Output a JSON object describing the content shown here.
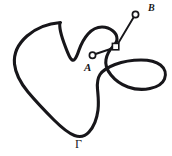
{
  "figure": {
    "kind": "jordan-curve-diagram",
    "background_color": "#ffffff",
    "ink_color": "#17161a",
    "width": 172,
    "height": 156,
    "labels": {
      "curve": "Γ",
      "inner_point": "A",
      "outer_point": "B"
    },
    "markers": {
      "point_a": {
        "name": "A",
        "shape": "open-circle",
        "x": 92,
        "y": 55
      },
      "point_b": {
        "name": "B",
        "shape": "open-circle",
        "x": 136,
        "y": 13
      },
      "crossing": {
        "name": "crossing-point",
        "shape": "open-square",
        "x": 116,
        "y": 47
      }
    },
    "paths": {
      "closed_curve": "M 92,30 C 84,24 73,20 60,21 C 44,22 30,29 22,42 C 14,55 13,70 18,84 C 24,99 38,113 52,124 C 62,132 72,138 80,138 C 88,138 95,131 100,122 C 105,112 104,101 101,93 C 98,86 95,80 97,74 C 100,67 108,63 116,60 C 126,57 138,58 148,63 C 157,68 163,76 161,84 C 159,92 150,96 140,96 C 128,96 117,92 110,85 C 104,79 102,71 104,64 C 106,56 112,51 116,47 C 120,43 122,39 122,35 C 122,29 118,24 112,22 C 105,20 97,23 91,29 C 85,35 81,43 78,50 C 76,55 74,59 72,61 C 70,63 68,62 66,59 C 64,55 62,49 60,44 C 58,38 56,33 56,30 C 56,27 58,25 62,24",
      "segment_a_to_crossing": "M 95,54 L 113,48",
      "segment_crossing_to_b": "M 118,44 L 134,17"
    }
  }
}
